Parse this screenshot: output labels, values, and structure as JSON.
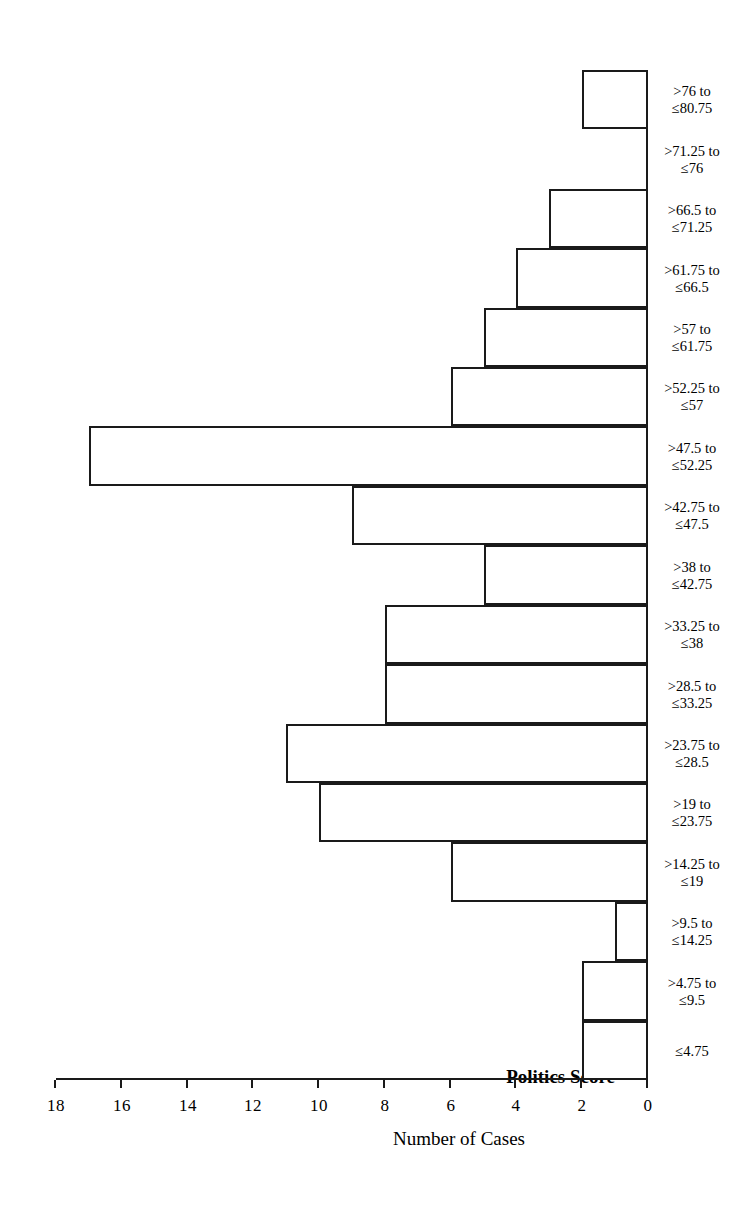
{
  "chart_data": {
    "type": "bar",
    "orientation": "horizontal",
    "title": "Politics Score",
    "xlabel": "Politics Score",
    "ylabel": "Number of Cases",
    "ylim": [
      0,
      18
    ],
    "yticks": [
      0,
      2,
      4,
      6,
      8,
      10,
      12,
      14,
      16,
      18
    ],
    "ytick_labels": [
      "0",
      "2",
      "4",
      "6",
      "8",
      "10",
      "12",
      "14",
      "16",
      "18"
    ],
    "grid": false,
    "legend": null,
    "rotation_note": "figure rendered rotated 180 degrees",
    "categories": [
      "≤4.75",
      ">4.75 to ≤9.5",
      ">9.5 to ≤14.25",
      ">14.25 to ≤19",
      ">19 to ≤23.75",
      ">23.75 to ≤28.5",
      ">28.5 to ≤33.25",
      ">33.25 to ≤38",
      ">38 to ≤42.75",
      ">42.75 to ≤47.5",
      ">47.5 to ≤52.25",
      ">52.25 to ≤57",
      ">57 to ≤61.75",
      ">61.75 to ≤66.5",
      ">66.5 to ≤71.25",
      ">71.25 to ≤76",
      ">76 to ≤80.75"
    ],
    "category_lines": [
      [
        "≤4.75",
        ""
      ],
      [
        ">4.75 to",
        "≤9.5"
      ],
      [
        ">9.5 to",
        "≤14.25"
      ],
      [
        ">14.25 to",
        "≤19"
      ],
      [
        ">19 to",
        "≤23.75"
      ],
      [
        ">23.75 to",
        "≤28.5"
      ],
      [
        ">28.5 to",
        "≤33.25"
      ],
      [
        ">33.25 to",
        "≤38"
      ],
      [
        ">38 to",
        "≤42.75"
      ],
      [
        ">42.75 to",
        "≤47.5"
      ],
      [
        ">47.5 to",
        "≤52.25"
      ],
      [
        ">52.25 to",
        "≤57"
      ],
      [
        ">57 to",
        "≤61.75"
      ],
      [
        ">61.75 to",
        "≤66.5"
      ],
      [
        ">66.5 to",
        "≤71.25"
      ],
      [
        ">71.25 to",
        "≤76"
      ],
      [
        ">76 to",
        "≤80.75"
      ]
    ],
    "values": [
      2,
      2,
      1,
      6,
      10,
      11,
      8,
      8,
      5,
      9,
      17,
      6,
      5,
      4,
      3,
      0,
      2
    ],
    "colors": {
      "bar_fill": "#ffffff",
      "bar_stroke": "#1a1a1a",
      "axis": "#1a1a1a",
      "text": "#000000",
      "background": "#ffffff"
    }
  }
}
